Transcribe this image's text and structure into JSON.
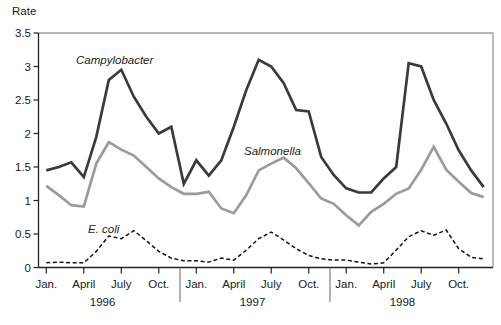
{
  "chart_data": {
    "type": "line",
    "title": "",
    "ylabel": "Rate",
    "xlabel": "",
    "ylim": [
      0,
      3.5
    ],
    "yticks": [
      0,
      0.5,
      1,
      1.5,
      2,
      2.5,
      3,
      3.5
    ],
    "ytick_labels": [
      "0",
      "0.5",
      "1",
      "1.5",
      "2",
      "2.5",
      "3",
      "3.5"
    ],
    "grid": "off",
    "legend_position": "inline-annotations",
    "x_tick_month_labels": [
      "Jan.",
      "April",
      "July",
      "Oct."
    ],
    "x_tick_month_indices": [
      0,
      3,
      6,
      9
    ],
    "years": [
      "1996",
      "1997",
      "1998"
    ],
    "months_per_year": 12,
    "series": [
      {
        "name": "Campylobacter",
        "style": "solid",
        "color": "#3a3a3a",
        "values": [
          1.45,
          1.5,
          1.57,
          1.35,
          1.95,
          2.8,
          2.95,
          2.55,
          2.25,
          2.0,
          2.1,
          1.25,
          1.6,
          1.37,
          1.6,
          2.1,
          2.65,
          3.1,
          3.0,
          2.75,
          2.35,
          2.33,
          1.65,
          1.38,
          1.18,
          1.12,
          1.12,
          1.33,
          1.5,
          3.05,
          3.0,
          2.5,
          2.15,
          1.75,
          1.45,
          1.2
        ]
      },
      {
        "name": "Salmonella",
        "style": "solid",
        "color": "#9b9b9b",
        "values": [
          1.22,
          1.08,
          0.93,
          0.91,
          1.55,
          1.87,
          1.76,
          1.67,
          1.5,
          1.33,
          1.2,
          1.1,
          1.1,
          1.13,
          0.88,
          0.81,
          1.08,
          1.45,
          1.55,
          1.64,
          1.48,
          1.26,
          1.03,
          0.95,
          0.78,
          0.63,
          0.83,
          0.95,
          1.1,
          1.18,
          1.46,
          1.8,
          1.46,
          1.28,
          1.11,
          1.05
        ]
      },
      {
        "name": "E. coli",
        "style": "dashed",
        "color": "#111111",
        "values": [
          0.07,
          0.08,
          0.07,
          0.07,
          0.24,
          0.47,
          0.43,
          0.55,
          0.4,
          0.24,
          0.14,
          0.1,
          0.1,
          0.08,
          0.14,
          0.11,
          0.26,
          0.43,
          0.53,
          0.41,
          0.28,
          0.18,
          0.13,
          0.11,
          0.11,
          0.08,
          0.05,
          0.07,
          0.26,
          0.46,
          0.55,
          0.48,
          0.56,
          0.28,
          0.15,
          0.13
        ]
      }
    ],
    "annotations": [
      {
        "text": "Campylobacter"
      },
      {
        "text": "Salmonella"
      },
      {
        "text": "E. coli"
      }
    ],
    "frame_colors": {
      "axis": "#222222",
      "top_right_border": "#9e9e9e",
      "separator": "#666666"
    }
  }
}
